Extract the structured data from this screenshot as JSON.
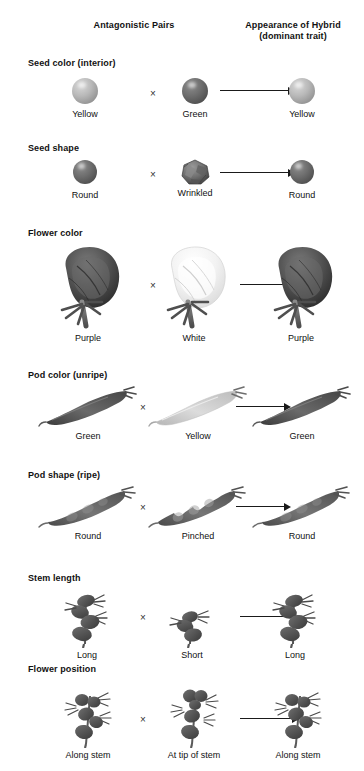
{
  "figure": {
    "type": "diagram",
    "palette": {
      "background": "#ffffff",
      "text": "#111111",
      "arrow": "#1a1a1a",
      "light_trait": "#c2c2c2",
      "dark_trait": "#5a5a5a"
    }
  },
  "headers": {
    "antagonistic_pairs": "Antagonistic Pairs",
    "hybrid_line1": "Appearance of Hybrid",
    "hybrid_line2": "(dominant trait)"
  },
  "symbols": {
    "cross": "×",
    "arrow": "→"
  },
  "traits": [
    {
      "name": "Seed color (interior)",
      "art": "sphere",
      "parent1": "Yellow",
      "parent2": "Green",
      "hybrid": "Yellow",
      "parent1_tone": "light",
      "parent2_tone": "dark",
      "hybrid_tone": "light"
    },
    {
      "name": "Seed shape",
      "art": "seed-shape",
      "parent1": "Round",
      "parent2": "Wrinkled",
      "hybrid": "Round",
      "parent1_tone": "dark",
      "parent2_tone": "dark",
      "hybrid_tone": "dark"
    },
    {
      "name": "Flower color",
      "art": "flower",
      "parent1": "Purple",
      "parent2": "White",
      "hybrid": "Purple",
      "parent1_tone": "dark",
      "parent2_tone": "light",
      "hybrid_tone": "dark"
    },
    {
      "name": "Pod color (unripe)",
      "art": "pod-color",
      "parent1": "Green",
      "parent2": "Yellow",
      "hybrid": "Green",
      "parent1_tone": "dark",
      "parent2_tone": "light",
      "hybrid_tone": "dark"
    },
    {
      "name": "Pod shape (ripe)",
      "art": "pod-shape",
      "parent1": "Round",
      "parent2": "Pinched",
      "hybrid": "Round",
      "parent1_tone": "dark",
      "parent2_tone": "dark",
      "hybrid_tone": "dark"
    },
    {
      "name": "Stem length",
      "art": "plant",
      "parent1": "Long",
      "parent2": "Short",
      "hybrid": "Long",
      "parent1_tone": "dark",
      "parent2_tone": "dark",
      "hybrid_tone": "dark"
    },
    {
      "name": "Flower position",
      "art": "plant-flower",
      "parent1": "Along stem",
      "parent2": "At tip of stem",
      "hybrid": "Along stem",
      "parent1_tone": "dark",
      "parent2_tone": "dark",
      "hybrid_tone": "dark"
    }
  ]
}
